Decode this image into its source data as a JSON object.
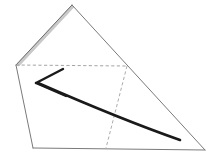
{
  "figure": {
    "title": "Origami fold step diagram",
    "background_color": "#ffffff",
    "width": 212,
    "height": 158
  },
  "colors": {
    "outline": "#6e6e6e",
    "outline_dark": "#4a4a4a",
    "crease_dashed": "#9a9a9a",
    "shaded_band": "#c9c9c9",
    "arrow": "#1a1a1a",
    "paper_fill": "#ffffff"
  },
  "geometry": {
    "apex": [
      72,
      5
    ],
    "left_vertex": [
      16,
      65
    ],
    "bottom_left": [
      33,
      148
    ],
    "bottom_right": [
      205,
      150
    ],
    "right_crease_junction": [
      127,
      66
    ],
    "dashed_bottom_end": [
      106,
      148
    ]
  },
  "shapes": {
    "outline_path": "M72,5 L205,150 L33,148 L16,65 Z",
    "right_edge_path": "M72,5 L205,150",
    "left_edge_upper_path": "M72,5 L16,65",
    "left_edge_lower_path": "M16,65 L33,148",
    "bottom_edge_path": "M33,148 L205,150",
    "shaded_band_path": "M72,5 L16,65 L19,66 L74,7 Z"
  },
  "creases": [
    {
      "name": "horizontal-crease",
      "style": "dashed",
      "path": "M16,65 L127,66",
      "meaning": "valley fold line across the middle of the sheet"
    },
    {
      "name": "slanted-crease",
      "style": "dashed",
      "path": "M127,66 L106,148",
      "meaning": "valley fold line descending to the bottom edge"
    }
  ],
  "arrow": {
    "name": "fold-arrow",
    "direction": "right-to-left",
    "tip": [
      36,
      83
    ],
    "tail_end": [
      180,
      140
    ],
    "tail_path": "M180,140 C140,126 86,104 38,83",
    "barb_upper_path": "M36,83 L63,69",
    "barb_lower_path": "M36,83 L66,96",
    "stroke_width_tail": 2.6,
    "stroke_width_barb": 2.4,
    "meaning": "fold the right portion over toward the left"
  }
}
